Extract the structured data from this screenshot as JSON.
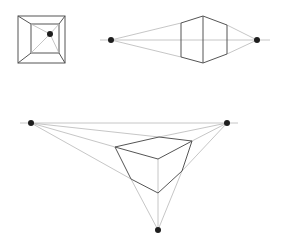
{
  "diagram": {
    "colors": {
      "background": "#ffffff",
      "guide_line": "#b8b8b8",
      "edge_line": "#555555",
      "vanishing_point": "#1e1e1e"
    },
    "panels": [
      {
        "name": "one-point-perspective",
        "vanishing_points": [
          [
            50,
            34
          ]
        ],
        "outer_square": [
          [
            18,
            16
          ],
          [
            65,
            16
          ],
          [
            65,
            63
          ],
          [
            18,
            63
          ]
        ],
        "inner_square": [
          [
            31,
            24
          ],
          [
            59,
            24
          ],
          [
            59,
            53
          ],
          [
            31,
            53
          ]
        ]
      },
      {
        "name": "two-point-perspective",
        "horizon_y": 40,
        "horizon_x": [
          100,
          270
        ],
        "vanishing_points": [
          [
            111,
            40
          ],
          [
            257,
            40
          ]
        ],
        "front_edge": [
          [
            203,
            16
          ],
          [
            203,
            63
          ]
        ],
        "left_edge": [
          [
            181,
            23
          ],
          [
            181,
            57
          ]
        ],
        "right_edge": [
          [
            227,
            25
          ],
          [
            227,
            54
          ]
        ]
      },
      {
        "name": "three-point-perspective",
        "horizon_y": 123,
        "horizon_x": [
          20,
          238
        ],
        "vanishing_points": [
          [
            31,
            123
          ],
          [
            227,
            123
          ],
          [
            158,
            230
          ]
        ],
        "top_face": [
          [
            115,
            147
          ],
          [
            159,
            137
          ],
          [
            192,
            141
          ],
          [
            158,
            159
          ]
        ],
        "bottom_vertices": {
          "front": [
            158,
            193
          ],
          "left": [
            131,
            179
          ],
          "right": [
            182,
            171
          ]
        }
      }
    ]
  }
}
